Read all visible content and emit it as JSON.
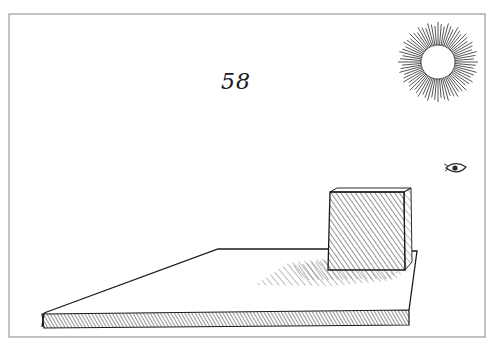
{
  "plate": {
    "number": "58",
    "description": "Perspective engraving: a cube on a flat board casting a shadow, lit by the sun"
  },
  "colors": {
    "ink": "#1a1a1a",
    "paper": "#ffffff",
    "frame": "#9a9a9a",
    "hatch": "#4a4a4a"
  },
  "elements": {
    "sun": {
      "cx": 438,
      "cy": 62,
      "inner_r": 17,
      "outer_r": 40,
      "rays": 72
    },
    "eye": {
      "cx": 456,
      "cy": 170
    },
    "frame": {
      "x": 9,
      "y": 14,
      "w": 476,
      "h": 323
    }
  }
}
